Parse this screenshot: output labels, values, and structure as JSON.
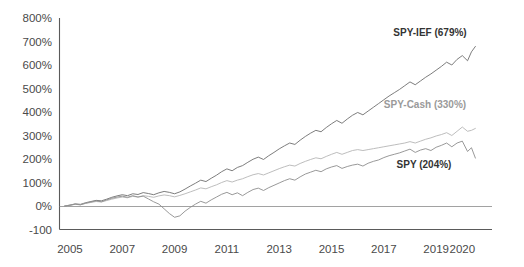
{
  "chart_data": {
    "type": "line",
    "title": "",
    "subtitle": "",
    "xlabel": "",
    "ylabel": "",
    "grid": false,
    "legend_position": "inline-right",
    "xlim": [
      2004.6,
      2020.6
    ],
    "ylim": [
      -100,
      800
    ],
    "y_ticks": [
      -100,
      0,
      100,
      200,
      300,
      400,
      500,
      600,
      700,
      800
    ],
    "y_tick_labels": [
      "-100",
      "0%",
      "100%",
      "200%",
      "300%",
      "400%",
      "500%",
      "600%",
      "700%",
      "800%"
    ],
    "x_ticks": [
      2005,
      2007,
      2009,
      2011,
      2013,
      2015,
      2017,
      2019,
      2020
    ],
    "x_tick_labels": [
      "2005",
      "2007",
      "2009",
      "2011",
      "2013",
      "2015",
      "2017",
      "2019",
      "2020"
    ],
    "x": [
      2004.8,
      2005.0,
      2005.2,
      2005.4,
      2005.6,
      2005.8,
      2006.0,
      2006.2,
      2006.4,
      2006.6,
      2006.8,
      2007.0,
      2007.2,
      2007.4,
      2007.6,
      2007.8,
      2008.0,
      2008.2,
      2008.4,
      2008.6,
      2008.8,
      2009.0,
      2009.2,
      2009.4,
      2009.6,
      2009.8,
      2010.0,
      2010.2,
      2010.4,
      2010.6,
      2010.8,
      2011.0,
      2011.2,
      2011.4,
      2011.6,
      2011.8,
      2012.0,
      2012.2,
      2012.4,
      2012.6,
      2012.8,
      2013.0,
      2013.2,
      2013.4,
      2013.6,
      2013.8,
      2014.0,
      2014.2,
      2014.4,
      2014.6,
      2014.8,
      2015.0,
      2015.2,
      2015.4,
      2015.6,
      2015.8,
      2016.0,
      2016.2,
      2016.4,
      2016.6,
      2016.8,
      2017.0,
      2017.2,
      2017.4,
      2017.6,
      2017.8,
      2018.0,
      2018.2,
      2018.4,
      2018.6,
      2018.8,
      2019.0,
      2019.2,
      2019.4,
      2019.6,
      2019.8,
      2020.0,
      2020.2,
      2020.35,
      2020.5
    ],
    "series": [
      {
        "name": "SPY-IEF",
        "final_label": "SPY-IEF (679%)",
        "final_value": 679,
        "color": "#6e6e6e",
        "label_color": "#333333",
        "label_xy": [
          430,
          36
        ],
        "values": [
          0,
          4,
          9,
          7,
          14,
          19,
          24,
          22,
          29,
          37,
          43,
          48,
          44,
          52,
          49,
          57,
          53,
          48,
          56,
          62,
          58,
          52,
          60,
          72,
          85,
          97,
          110,
          104,
          118,
          131,
          146,
          158,
          150,
          164,
          172,
          186,
          199,
          208,
          198,
          214,
          228,
          243,
          256,
          268,
          262,
          280,
          296,
          310,
          322,
          316,
          334,
          350,
          364,
          352,
          370,
          386,
          398,
          388,
          404,
          420,
          436,
          452,
          468,
          482,
          496,
          512,
          528,
          516,
          532,
          548,
          562,
          578,
          594,
          612,
          600,
          624,
          640,
          618,
          656,
          679
        ]
      },
      {
        "name": "SPY-Cash",
        "final_label": "SPY-Cash (330%)",
        "final_value": 330,
        "color": "#b5b5b5",
        "label_color": "#9a9a9a",
        "label_xy": [
          425,
          108
        ],
        "values": [
          0,
          3,
          7,
          5,
          11,
          15,
          19,
          17,
          23,
          29,
          34,
          38,
          35,
          41,
          38,
          44,
          41,
          37,
          43,
          47,
          44,
          39,
          45,
          52,
          60,
          68,
          77,
          73,
          82,
          90,
          100,
          108,
          102,
          110,
          116,
          125,
          133,
          138,
          132,
          141,
          150,
          159,
          167,
          174,
          170,
          181,
          190,
          198,
          205,
          201,
          211,
          220,
          228,
          220,
          228,
          236,
          240,
          236,
          240,
          244,
          248,
          252,
          256,
          260,
          264,
          268,
          274,
          268,
          276,
          284,
          290,
          298,
          304,
          312,
          300,
          318,
          336,
          318,
          322,
          330
        ]
      },
      {
        "name": "SPY",
        "final_label": "SPY (204%)",
        "final_value": 204,
        "color": "#8d8d8d",
        "label_color": "#333333",
        "label_xy": [
          424,
          168
        ],
        "values": [
          0,
          3,
          8,
          5,
          12,
          17,
          22,
          18,
          26,
          33,
          38,
          42,
          37,
          44,
          38,
          42,
          30,
          18,
          8,
          -12,
          -32,
          -48,
          -42,
          -22,
          -6,
          8,
          20,
          12,
          26,
          38,
          50,
          58,
          48,
          56,
          44,
          58,
          70,
          76,
          66,
          78,
          88,
          98,
          108,
          116,
          110,
          124,
          136,
          144,
          152,
          146,
          158,
          166,
          172,
          160,
          168,
          174,
          178,
          170,
          182,
          190,
          196,
          206,
          214,
          220,
          226,
          234,
          242,
          228,
          238,
          244,
          236,
          250,
          258,
          268,
          252,
          268,
          276,
          232,
          248,
          204
        ]
      }
    ]
  }
}
